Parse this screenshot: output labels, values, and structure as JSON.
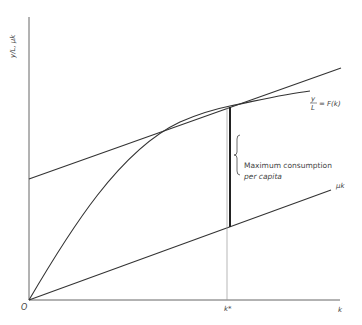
{
  "diagram": {
    "y_axis_label": "y/L, μk",
    "x_axis_label": "k",
    "origin_label": "O",
    "kstar_label": "k*",
    "curve_label_frac_num": "y",
    "curve_label_frac_den": "L",
    "curve_label_rest": "= F(k)",
    "line_label": "μk",
    "annotation_line1": "Maximum consumption",
    "annotation_line2": "per capita"
  }
}
